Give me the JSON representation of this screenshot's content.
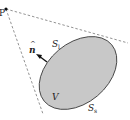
{
  "diagram": {
    "type": "geometry",
    "point_label": "P",
    "normal_label": "n",
    "normal_hat": "^",
    "lit_surface_label": "S",
    "lit_surface_sub": "l",
    "shadow_surface_label": "S",
    "shadow_surface_sub": "s",
    "volume_label": "V",
    "colors": {
      "body_fill": "#c8c8c8",
      "outline": "#444444",
      "dashed": "#777777",
      "arrow": "#111111"
    }
  }
}
